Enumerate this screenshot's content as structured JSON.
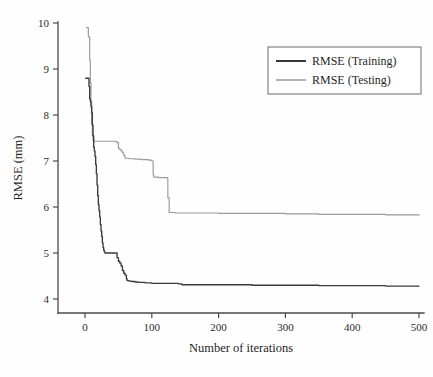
{
  "figure": {
    "background": "#fefefe",
    "width": 433,
    "height": 377
  },
  "chart_data": {
    "type": "line",
    "title": "",
    "subtitle": "",
    "xlabel": "Number of iterations",
    "ylabel": "RMSE (mm)",
    "xlim": [
      0,
      500
    ],
    "ylim": [
      4,
      10
    ],
    "xticks": [
      0,
      100,
      200,
      300,
      400,
      500
    ],
    "yticks": [
      4,
      5,
      6,
      7,
      8,
      9,
      10
    ],
    "xtick_labels": [
      "0",
      "100",
      "200",
      "300",
      "400",
      "500"
    ],
    "ytick_labels": [
      "4",
      "5",
      "6",
      "7",
      "8",
      "9",
      "10"
    ],
    "grid": false,
    "legend_position": "top-right",
    "series": [
      {
        "name": "RMSE (Training)",
        "color": "#3a3a3a",
        "x": [
          1,
          4,
          6,
          7,
          8,
          9,
          10,
          11,
          12,
          13,
          14,
          15,
          16,
          17,
          18,
          19,
          20,
          21,
          22,
          23,
          24,
          25,
          26,
          27,
          28,
          29,
          30,
          33,
          36,
          40,
          44,
          47,
          48,
          50,
          52,
          54,
          56,
          58,
          60,
          62,
          63,
          66,
          70,
          75,
          80,
          90,
          100,
          120,
          140,
          145,
          160,
          200,
          250,
          300,
          350,
          400,
          450,
          500
        ],
        "values": [
          8.8,
          8.8,
          8.62,
          8.35,
          8.3,
          8.18,
          8.05,
          7.78,
          7.55,
          7.3,
          7.22,
          7.1,
          6.92,
          6.72,
          6.48,
          6.25,
          6.05,
          5.92,
          5.78,
          5.62,
          5.48,
          5.36,
          5.22,
          5.12,
          5.06,
          5.02,
          5.0,
          5.0,
          5.0,
          5.0,
          5.0,
          5.0,
          4.9,
          4.82,
          4.78,
          4.72,
          4.62,
          4.56,
          4.52,
          4.44,
          4.4,
          4.39,
          4.38,
          4.37,
          4.36,
          4.35,
          4.34,
          4.34,
          4.33,
          4.31,
          4.31,
          4.31,
          4.3,
          4.3,
          4.29,
          4.29,
          4.28,
          4.28
        ]
      },
      {
        "name": "RMSE (Testing)",
        "color": "#9a9a9a",
        "x": [
          2,
          5,
          7,
          8,
          9,
          10,
          11,
          12,
          14,
          20,
          30,
          40,
          46,
          48,
          50,
          52,
          54,
          56,
          58,
          60,
          66,
          75,
          85,
          95,
          100,
          102,
          103,
          110,
          118,
          123,
          124,
          126,
          135,
          160,
          200,
          250,
          300,
          350,
          400,
          450,
          500
        ],
        "values": [
          9.9,
          9.7,
          9.2,
          8.7,
          8.25,
          7.8,
          7.55,
          7.44,
          7.43,
          7.43,
          7.43,
          7.43,
          7.42,
          7.4,
          7.28,
          7.25,
          7.22,
          7.18,
          7.12,
          7.06,
          7.05,
          7.04,
          7.03,
          7.02,
          7.0,
          6.7,
          6.65,
          6.64,
          6.64,
          6.63,
          6.2,
          5.88,
          5.87,
          5.87,
          5.86,
          5.86,
          5.85,
          5.84,
          5.84,
          5.83,
          5.82
        ]
      }
    ],
    "annotations": []
  },
  "legend": {
    "entries": [
      {
        "label": "RMSE (Training)",
        "color": "#3a3a3a",
        "swatch": "line-swatch-training"
      },
      {
        "label": "RMSE (Testing)",
        "color": "#9a9a9a",
        "swatch": "line-swatch-testing"
      }
    ]
  }
}
